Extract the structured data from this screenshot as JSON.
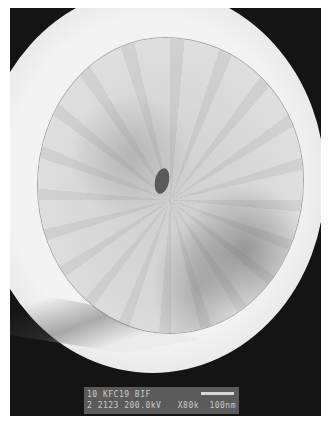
{
  "image": {
    "kind": "transmission electron micrograph",
    "subject": "round particle with radial striations and a dark central core",
    "background_color": "#141414",
    "border_color": "#ffffff"
  },
  "caption": {
    "line1": "10 KFC19 BIF",
    "line2_left": "2 2123 200.0kV",
    "magnification": "X80k",
    "scale_label": "100nm"
  }
}
